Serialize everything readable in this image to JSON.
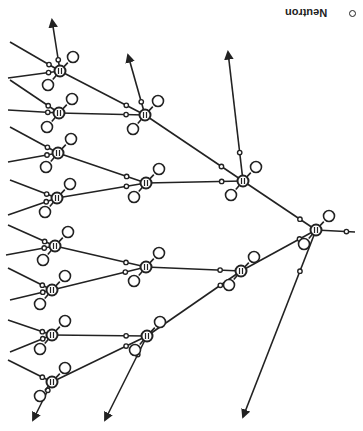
{
  "diagram": {
    "orientation": "rotated-180",
    "legend": {
      "neutron_label": "Neutron"
    },
    "colors": {
      "stroke": "#222222",
      "background": "#ffffff"
    },
    "root": {
      "x": 316,
      "y": 230
    },
    "level2": [
      {
        "x": 243,
        "y": 181
      },
      {
        "x": 241,
        "y": 271
      }
    ],
    "level3": [
      {
        "x": 145,
        "y": 115
      },
      {
        "x": 146,
        "y": 183
      },
      {
        "x": 146,
        "y": 267
      },
      {
        "x": 147,
        "y": 336
      }
    ],
    "level4": [
      {
        "x": 60,
        "y": 71
      },
      {
        "x": 59,
        "y": 113
      },
      {
        "x": 58,
        "y": 153
      },
      {
        "x": 57,
        "y": 198
      },
      {
        "x": 55,
        "y": 246
      },
      {
        "x": 52,
        "y": 290
      },
      {
        "x": 52,
        "y": 335
      },
      {
        "x": 52,
        "y": 382
      }
    ]
  }
}
